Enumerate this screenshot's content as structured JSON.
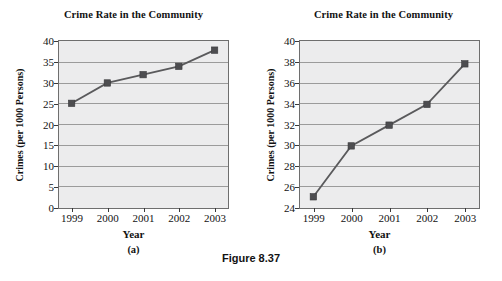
{
  "figure": {
    "caption": "Figure 8.37"
  },
  "panels": [
    {
      "tag": "(a)",
      "title": "Crime Rate in the Community",
      "xlabel": "Year",
      "ylabel": "Crimes (per 1000 Persons)",
      "ytick_labels": [
        "40",
        "35",
        "30",
        "25",
        "20",
        "15",
        "10",
        "5",
        "0"
      ],
      "xtick_labels": [
        "1999",
        "2000",
        "2001",
        "2002",
        "2003"
      ]
    },
    {
      "tag": "(b)",
      "title": "Crime Rate in the Community",
      "xlabel": "Year",
      "ylabel": "Crimes (per 1000 Persons)",
      "ytick_labels": [
        "40",
        "38",
        "36",
        "34",
        "32",
        "30",
        "28",
        "26",
        "24"
      ],
      "xtick_labels": [
        "1999",
        "2000",
        "2001",
        "2002",
        "2003"
      ]
    }
  ],
  "chart_data": [
    {
      "type": "line",
      "title": "Crime Rate in the Community",
      "subtitle": "(a)",
      "xlabel": "Year",
      "ylabel": "Crimes (per 1000 Persons)",
      "categories": [
        "1999",
        "2000",
        "2001",
        "2002",
        "2003"
      ],
      "x": [
        1999,
        2000,
        2001,
        2002,
        2003
      ],
      "values": [
        25.0,
        29.9,
        31.9,
        33.9,
        37.8
      ],
      "ylim": [
        0,
        40
      ],
      "yticks": [
        0,
        5,
        10,
        15,
        20,
        25,
        30,
        35,
        40
      ],
      "grid": true,
      "legend": false,
      "marker": "square",
      "plot_bg": "#ececed",
      "line_color": "#5a5a5c",
      "marker_color": "#4d4d50",
      "grid_color": "#9b9b9b"
    },
    {
      "type": "line",
      "title": "Crime Rate in the Community",
      "subtitle": "(b)",
      "xlabel": "Year",
      "ylabel": "Crimes (per 1000 Persons)",
      "categories": [
        "1999",
        "2000",
        "2001",
        "2002",
        "2003"
      ],
      "x": [
        1999,
        2000,
        2001,
        2002,
        2003
      ],
      "values": [
        25.0,
        29.9,
        31.9,
        33.9,
        37.8
      ],
      "ylim": [
        24,
        40
      ],
      "yticks": [
        24,
        26,
        28,
        30,
        32,
        34,
        36,
        38,
        40
      ],
      "grid": true,
      "legend": false,
      "marker": "square",
      "plot_bg": "#ececed",
      "line_color": "#5a5a5c",
      "marker_color": "#4d4d50",
      "grid_color": "#9b9b9b"
    }
  ]
}
